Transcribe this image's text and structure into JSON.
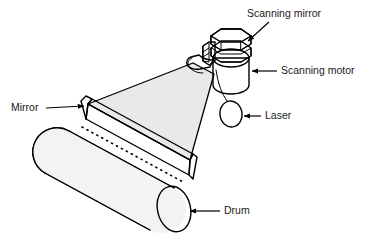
{
  "figure": {
    "background_color": "#ffffff",
    "line_color": "#000000",
    "beam_fill": "#e9e9e9",
    "surface_fill": "#ececec",
    "highlight_fill": "#ffffff",
    "width": 371,
    "height": 241
  },
  "labels": {
    "scanning_mirror": "Scanning mirror",
    "scanning_motor": "Scanning motor",
    "laser": "Laser",
    "mirror": "Mirror",
    "drum": "Drum"
  },
  "components": [
    {
      "id": "scanning-mirror",
      "label": "Scanning mirror",
      "label_x": 247,
      "label_y": 14,
      "leader_from": [
        268,
        22
      ],
      "leader_to": [
        246,
        44
      ],
      "arrow": "down-left"
    },
    {
      "id": "scanning-motor",
      "label": "Scanning motor",
      "label_x": 279,
      "label_y": 71,
      "leader_from": [
        276,
        71
      ],
      "leader_to": [
        249,
        71
      ],
      "arrow": "left"
    },
    {
      "id": "laser",
      "label": "Laser",
      "label_x": 263,
      "label_y": 116,
      "leader_from": [
        260,
        116
      ],
      "leader_to": [
        237,
        116
      ],
      "arrow": "left"
    },
    {
      "id": "mirror",
      "label": "Mirror",
      "label_x": 12,
      "label_y": 108,
      "leader_from": [
        46,
        108
      ],
      "leader_to": [
        85,
        108
      ],
      "arrow": "right"
    },
    {
      "id": "drum",
      "label": "Drum",
      "label_x": 222,
      "label_y": 211,
      "leader_from": [
        219,
        211
      ],
      "leader_to": [
        191,
        211
      ],
      "arrow": "left"
    }
  ]
}
